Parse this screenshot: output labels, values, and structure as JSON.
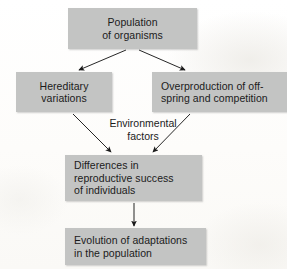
{
  "diagram": {
    "box_fill_color": "#c3c4c3",
    "text_color": "#1b1b1b",
    "background_color": "#fdfdfc",
    "nodes": {
      "population": {
        "line1": "Population",
        "line2": "of organisms"
      },
      "hereditary": {
        "line1": "Hereditary",
        "line2": "variations"
      },
      "overproduction": {
        "line1": "Overproduction of off-",
        "line2": "spring and competition"
      },
      "differences": {
        "line1": "Differences in",
        "line2": "reproductive success",
        "line3": "of individuals"
      },
      "evolution": {
        "line1": "Evolution of adaptations",
        "line2": "in the population"
      }
    },
    "labels": {
      "environmental": {
        "line1": "Environmental",
        "line2": "factors"
      }
    },
    "arrows": [
      {
        "name": "population-to-hereditary",
        "from": "population",
        "to": "hereditary"
      },
      {
        "name": "population-to-overproduction",
        "from": "population",
        "to": "overproduction"
      },
      {
        "name": "hereditary-to-differences",
        "from": "hereditary",
        "to": "differences"
      },
      {
        "name": "overproduction-to-differences",
        "from": "overproduction",
        "to": "differences"
      },
      {
        "name": "differences-to-evolution",
        "from": "differences",
        "to": "evolution"
      }
    ]
  }
}
